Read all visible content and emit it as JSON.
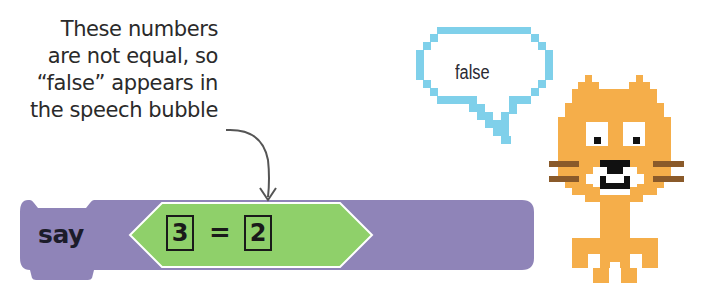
{
  "annotation": {
    "lines": [
      "These numbers",
      "are not equal, so",
      "“false” appears in",
      "the speech bubble"
    ]
  },
  "block": {
    "label": "say",
    "color": "#8f84b8",
    "operator": {
      "type": "equals",
      "left_value": "3",
      "symbol": "=",
      "right_value": "2",
      "color": "#8fd06a"
    }
  },
  "speech_bubble": {
    "text": "false",
    "border_color": "#7fd0ea"
  },
  "sprite": {
    "name": "cat",
    "body_color": "#f5ae4a",
    "whisker_color": "#8a5a2a"
  }
}
